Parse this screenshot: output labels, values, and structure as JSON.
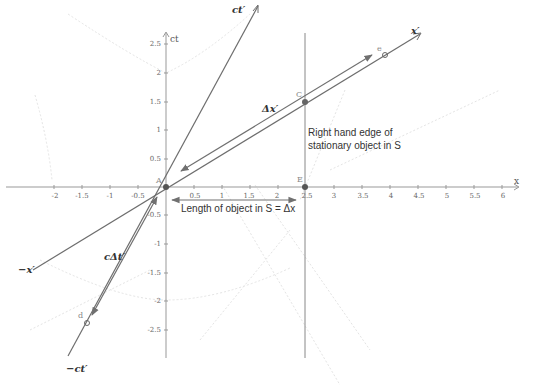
{
  "diagram": {
    "type": "spacetime-minkowski-diagram",
    "axes": {
      "x_label": "x",
      "y_label": "ct",
      "x_ticks": [
        "-2",
        "-1.5",
        "-1",
        "-0.5",
        "0.5",
        "1",
        "1.5",
        "2",
        "2.5",
        "3",
        "3.5",
        "4",
        "4.5",
        "5",
        "5.5",
        "6"
      ],
      "y_ticks_pos": [
        "0.5",
        "1",
        "1.5",
        "2",
        "2.5"
      ],
      "y_ticks_neg": [
        "-0.5",
        "-1",
        "-1.5",
        "-2",
        "-2.5"
      ],
      "origin_label": "0"
    },
    "lines": {
      "ct_prime": "ct′",
      "neg_ct_prime": "−ct′",
      "x_prime": "x′",
      "neg_x_prime": "−x′"
    },
    "points": {
      "A": "A",
      "C": "C",
      "E": "E",
      "e": "e",
      "d": "d"
    },
    "labels": {
      "delta_x_prime": "Δx′",
      "c_delta_t_prime": "cΔt′",
      "length_of_object": "Length of object in S = Δx",
      "right_edge_line1": "Right hand edge of",
      "right_edge_line2": "stationary object in S"
    },
    "colors": {
      "axis": "#888888",
      "line": "#6e6e6e",
      "point": "#555555",
      "hyperbola": "#e2e2e2",
      "text": "#333333"
    }
  }
}
